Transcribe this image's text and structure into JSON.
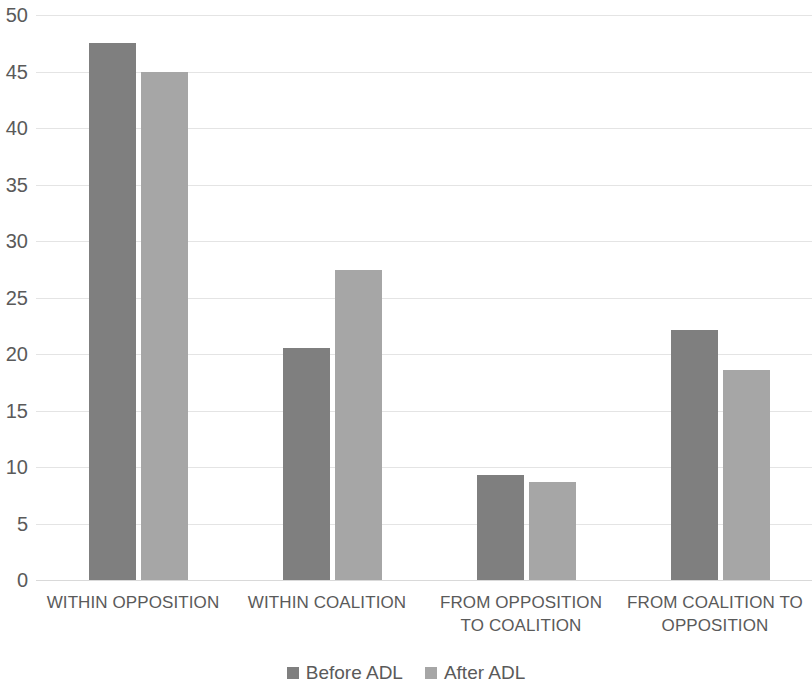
{
  "chart_data": {
    "type": "bar",
    "title": "",
    "subtitle": "",
    "xlabel": "",
    "ylabel": "",
    "ylim": [
      0,
      50
    ],
    "y_ticks": [
      0,
      5,
      10,
      15,
      20,
      25,
      30,
      35,
      40,
      45,
      50
    ],
    "y_tick_labels": [
      "0",
      "5",
      "10",
      "15",
      "20",
      "25",
      "30",
      "35",
      "40",
      "45",
      "50"
    ],
    "grid": true,
    "legend_position": "bottom-center",
    "categories": [
      "WITHIN OPPOSITION",
      "WITHIN COALITION",
      "FROM OPPOSITION TO COALITION",
      "FROM COALITION TO OPPOSITION"
    ],
    "category_lines": [
      [
        "WITHIN OPPOSITION"
      ],
      [
        "WITHIN COALITION"
      ],
      [
        "FROM OPPOSITION",
        "TO COALITION"
      ],
      [
        "FROM COALITION TO",
        "OPPOSITION"
      ]
    ],
    "series": [
      {
        "name": "Before ADL",
        "color": "#7f7f7f",
        "values": [
          47.5,
          20.5,
          9.3,
          22.1
        ]
      },
      {
        "name": "After ADL",
        "color": "#a6a6a6",
        "values": [
          45.0,
          27.4,
          8.7,
          18.6
        ]
      }
    ]
  },
  "legend": {
    "items": [
      {
        "label": "Before ADL",
        "swatch": "before"
      },
      {
        "label": "After ADL",
        "swatch": "after"
      }
    ]
  },
  "colors": {
    "before_adl": "#7f7f7f",
    "after_adl": "#a6a6a6",
    "text": "#5a5a5a",
    "gridline": "#e4e4e4",
    "background": "#ffffff"
  }
}
